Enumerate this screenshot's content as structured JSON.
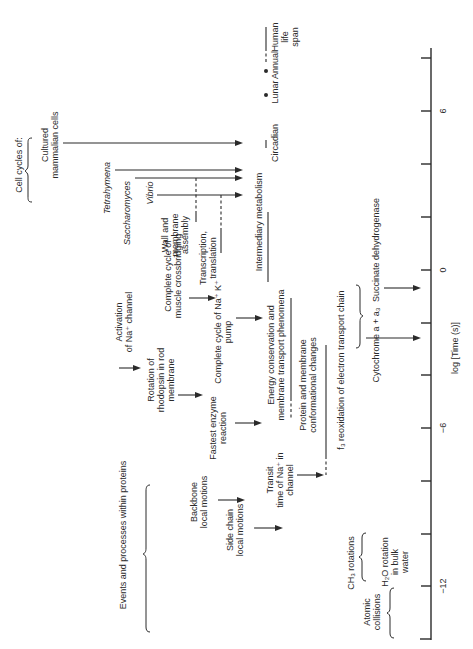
{
  "figure": {
    "orientation": "rotated-90-ccw",
    "axis": {
      "label": "log [Time (s)]",
      "ticks": [
        "6",
        "0",
        "−6",
        "−12"
      ],
      "range": [
        -14,
        8
      ]
    },
    "groups": {
      "cell_cycles": "Cell cycles of:",
      "proteins": "Events and processes within proteins"
    },
    "organisms": {
      "mammalian_1": "Cultured",
      "mammalian_2": "mammalian cells",
      "tetrahymena": "Tetrahymena",
      "saccharomyces": "Saccharomyces",
      "vibrio": "Vibrio"
    },
    "rhythms": {
      "circadian": "Circadian",
      "lunar": "Lunar",
      "annual": "Annual",
      "human_1": "Human",
      "human_2": "life",
      "human_3": "span"
    },
    "processes": {
      "wall_1": "Wall and",
      "wall_2": "membrane",
      "wall_3": "assembly",
      "transcription_1": "Transcription,",
      "transcription_2": "translation",
      "intermediary": "Intermediary metabolism",
      "muscle_1": "Complete cycle of",
      "muscle_2": "muscle crossbridging",
      "pump_1": "Complete cycle of Na⁺ K⁺",
      "pump_2": "pump",
      "energy_1": "Energy conservation and",
      "energy_2": "membrane transport phenomena",
      "activation_1": "Activation",
      "activation_2": "of Na⁺ channel",
      "rhodopsin_1": "Rotation of",
      "rhodopsin_2": "rhodopsin in rod",
      "rhodopsin_3": "membrane",
      "enzyme_1": "Fastest enzyme",
      "enzyme_2": "reaction",
      "protein_conf_1": "Protein and membrane",
      "protein_conf_2": "conformational changes",
      "electron": "f₃ reoxidation of electron transport chain",
      "cytochrome": "Cytochrome a + a₃",
      "succinate": "Succinate dehydrogenase",
      "backbone_1": "Backbone",
      "backbone_2": "local motions",
      "sidechain_1": "Side chain",
      "sidechain_2": "local motions",
      "transit_1": "Transit",
      "transit_2": "time of Na⁺ in",
      "transit_3": "channel",
      "ch3": "CH₃ rotations",
      "h2o_1": "H₂O rotation",
      "h2o_2": "in bulk",
      "h2o_3": "water",
      "atomic_1": "Atomic",
      "atomic_2": "collisions"
    }
  }
}
